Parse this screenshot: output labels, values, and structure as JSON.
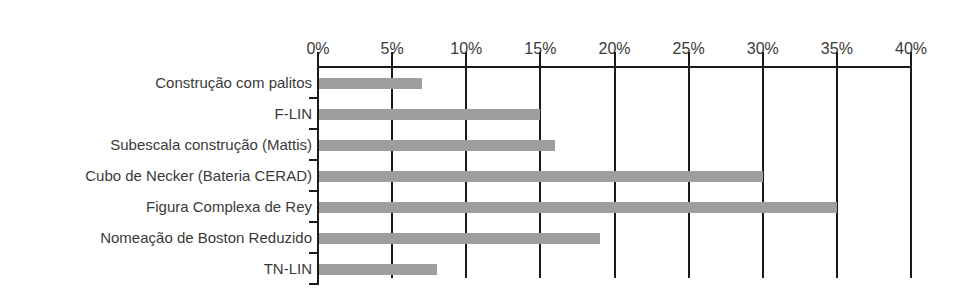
{
  "chart_data": {
    "type": "bar",
    "orientation": "horizontal",
    "title": "",
    "xlabel": "",
    "ylabel": "",
    "xlim": [
      0,
      40
    ],
    "x_ticks": [
      "0%",
      "5%",
      "10%",
      "15%",
      "20%",
      "25%",
      "30%",
      "35%",
      "40%"
    ],
    "tick_values": [
      0,
      5,
      10,
      15,
      20,
      25,
      30,
      35,
      40
    ],
    "grid": "vertical lines at each tick",
    "axis_position": "top",
    "categories": [
      "Construção com palitos",
      "F-LIN",
      "Subescala construção (Mattis)",
      "Cubo de Necker (Bateria CERAD)",
      "Figura Complexa de Rey",
      "Nomeação de Boston Reduzido",
      "TN-LIN"
    ],
    "values": [
      7,
      15,
      16,
      30,
      35,
      19,
      8
    ],
    "unit": "%",
    "bar_color": "#9e9e9e",
    "legend": null
  }
}
